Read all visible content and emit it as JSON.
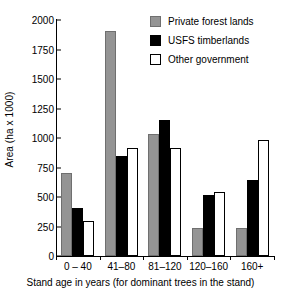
{
  "chart_data": {
    "type": "bar",
    "title": "",
    "xlabel": "Stand age in years (for dominant trees in the stand)",
    "ylabel": "Area (ha x 1000)",
    "ylim": [
      0,
      2000
    ],
    "yticks": [
      0,
      250,
      500,
      750,
      1000,
      1250,
      1500,
      1750,
      2000
    ],
    "grid": false,
    "legend_position": "top-right",
    "categories": [
      "0 – 40",
      "41–80",
      "81–120",
      "120–160",
      "160+"
    ],
    "series": [
      {
        "name": "Private forest lands",
        "color": "#949494",
        "values": [
          700,
          1910,
          1030,
          235,
          235
        ]
      },
      {
        "name": "USFS timberlands",
        "color": "#000000",
        "values": [
          410,
          845,
          1150,
          515,
          640
        ]
      },
      {
        "name": "Other government",
        "color": "#ffffff",
        "values": [
          295,
          915,
          915,
          540,
          985
        ]
      }
    ]
  }
}
